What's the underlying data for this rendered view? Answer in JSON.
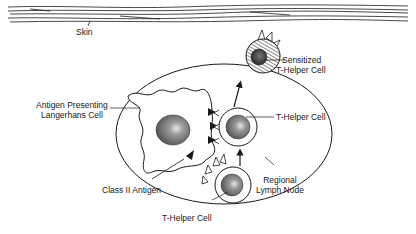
{
  "labels": {
    "skin": "Skin",
    "sensitized_line1": "Sensitized",
    "sensitized_line2": "T-Helper Cell",
    "apc_line1": "Antigen Presenting",
    "apc_line2": "Langerhans Cell",
    "thelper_mid": "T-Helper Cell",
    "class2": "Class II Antigen",
    "lymph_line1": "Regional",
    "lymph_line2": "Lymph Node",
    "thelper_bottom": "T-Helper Cell"
  },
  "colors": {
    "ink": "#1a1a1a",
    "background": "#ffffff",
    "nucleus": "#8c8c8c"
  }
}
